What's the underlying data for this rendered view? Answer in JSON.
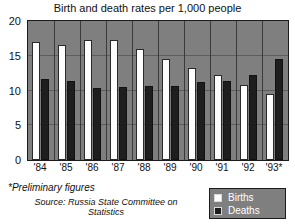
{
  "chart_data": {
    "type": "bar",
    "title": "Birth and death rates per 1,000 people",
    "xlabel": "",
    "ylabel": "",
    "ylim": [
      0,
      20
    ],
    "yticks": [
      0,
      5,
      10,
      15,
      20
    ],
    "ytick_labels": [
      "0",
      "5",
      "10",
      "15",
      "20"
    ],
    "grid": true,
    "legend_position": "bottom-right",
    "categories": [
      "'84",
      "'85",
      "'86",
      "'87",
      "'88",
      "'89",
      "'90",
      "'91",
      "'92",
      "'93*"
    ],
    "series": [
      {
        "name": "Births",
        "color": "#fdfdfd",
        "values": [
          17.0,
          16.6,
          17.2,
          17.2,
          16.0,
          14.6,
          13.3,
          12.2,
          10.8,
          9.5
        ]
      },
      {
        "name": "Deaths",
        "color": "#1e1e1e",
        "values": [
          11.6,
          11.3,
          10.4,
          10.5,
          10.7,
          10.6,
          11.2,
          11.4,
          12.2,
          14.5
        ]
      }
    ],
    "notes": [
      "*Preliminary figures",
      "Source: Russia State Committee on Statistics"
    ]
  },
  "footnotes": {
    "preliminary": "*Preliminary figures",
    "source": "Source: Russia State Committee on Statistics"
  },
  "legend": {
    "births_label": "Births",
    "deaths_label": "Deaths"
  },
  "colors": {
    "plot_background": "#7f7f7f",
    "births_bar": "#fdfdfd",
    "deaths_bar": "#1e1e1e",
    "frame": "#1b1b1b",
    "text": "#111111"
  }
}
